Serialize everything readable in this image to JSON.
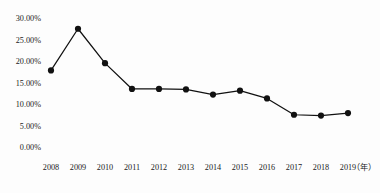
{
  "chart_data": {
    "type": "line",
    "title": "",
    "subtitle": "",
    "xlabel": "年",
    "ylabel": "",
    "categories": [
      "2008",
      "2009",
      "2010",
      "2011",
      "2012",
      "2013",
      "2014",
      "2015",
      "2016",
      "2017",
      "2018",
      "2019"
    ],
    "values": [
      17.8,
      27.5,
      19.5,
      13.5,
      13.5,
      13.4,
      12.2,
      13.1,
      11.3,
      7.5,
      7.3,
      7.9
    ],
    "series": [
      {
        "name": "",
        "values": [
          17.8,
          27.5,
          19.5,
          13.5,
          13.5,
          13.4,
          12.2,
          13.1,
          11.3,
          7.5,
          7.3,
          7.9
        ]
      }
    ],
    "ylim": [
      0,
      30
    ],
    "ytick_values": [
      0,
      5,
      10,
      15,
      20,
      25,
      30
    ],
    "ytick_labels": [
      "0.00%",
      "5.00%",
      "10.00%",
      "15.00%",
      "20.00%",
      "25.00%",
      "30.00%"
    ],
    "xtick_labels": [
      "2008",
      "2009",
      "2010",
      "2011",
      "2012",
      "2013",
      "2014",
      "2015",
      "2016",
      "2017",
      "2018",
      "2019"
    ],
    "x_axis_unit_label": "（年）",
    "grid": false,
    "legend": "none",
    "marker": "circle",
    "line_color": "#111111",
    "marker_color": "#111111",
    "background_color": "#fdfdfd",
    "text_color": "#1a1a1a"
  }
}
